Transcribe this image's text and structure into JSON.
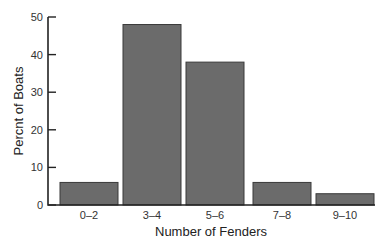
{
  "chart_data": {
    "type": "bar",
    "title": "",
    "xlabel": "Number of Fenders",
    "ylabel": "Percnt of Boats",
    "categories": [
      "0–2",
      "3–4",
      "5–6",
      "7–8",
      "9–10"
    ],
    "values": [
      6,
      48,
      38,
      6,
      3
    ],
    "ylim": [
      0,
      50
    ],
    "yticks": [
      0,
      10,
      20,
      30,
      40,
      50
    ],
    "grid": false,
    "legend": null,
    "colors": {
      "bar": "#6b6b6b",
      "bar_border": "#3a3a3a",
      "axis": "#222222"
    }
  }
}
